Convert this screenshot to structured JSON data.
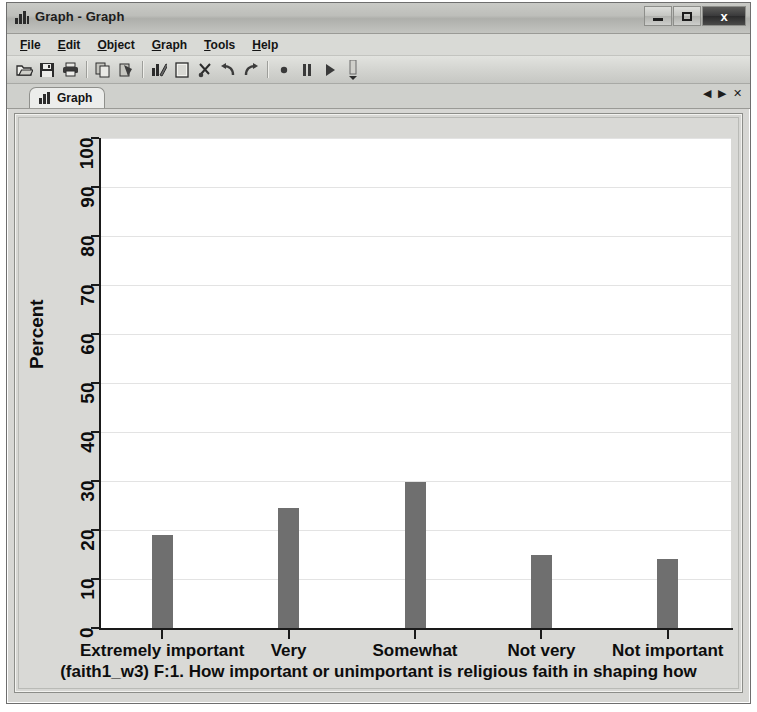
{
  "window": {
    "title": "Graph - Graph",
    "title_icon": "bar-chart-icon",
    "controls": {
      "minimize": "minimize-icon",
      "maximize": "maximize-icon",
      "close": "x"
    }
  },
  "menu": {
    "items": [
      {
        "acc": "F",
        "rest": "ile"
      },
      {
        "acc": "E",
        "rest": "dit"
      },
      {
        "acc": "O",
        "rest": "bject"
      },
      {
        "acc": "G",
        "rest": "raph"
      },
      {
        "acc": "T",
        "rest": "ools"
      },
      {
        "acc": "H",
        "rest": "elp"
      }
    ]
  },
  "toolbar": {
    "buttons": [
      "open-icon",
      "save-icon",
      "print-icon",
      "sep",
      "copy-icon",
      "paste-icon",
      "sep",
      "graph-editor-icon",
      "new-document-icon",
      "cut-icon",
      "undo-icon",
      "redo-icon",
      "sep",
      "record-icon",
      "pause-icon",
      "play-icon",
      "more-icon"
    ]
  },
  "tabs": {
    "active": "Graph",
    "icon": "bar-chart-icon",
    "nav": {
      "prev": "◀",
      "next": "▶",
      "close": "✕"
    }
  },
  "chart_data": {
    "type": "bar",
    "title": "",
    "categories": [
      "Extremely important",
      "Very",
      "Somewhat",
      "Not very",
      "Not important"
    ],
    "values": [
      19,
      24.4,
      29.8,
      15,
      14
    ],
    "xlabel": "(faith1_w3) F:1. How important or unimportant is religious faith in shaping how",
    "ylabel": "Percent",
    "ylim": [
      0,
      100
    ],
    "yticks": [
      0,
      10,
      20,
      30,
      40,
      50,
      60,
      70,
      80,
      90,
      100
    ],
    "grid": true,
    "legend": "none",
    "bar_color": "#6f6f6f",
    "plot_background": "#ffffff",
    "figure_background": "#d9d9d6"
  }
}
